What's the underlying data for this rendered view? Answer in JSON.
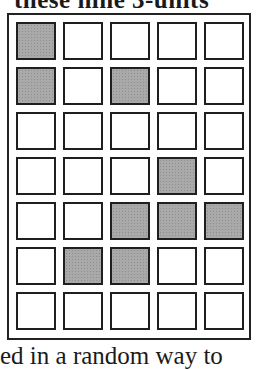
{
  "caption_top": "these nine 3-units",
  "caption_bottom": "ed in a random way to",
  "grid": {
    "rows": 7,
    "cols": 5,
    "shaded_color": "#a9a9a9",
    "cells": [
      [
        1,
        0,
        0,
        0,
        0
      ],
      [
        1,
        0,
        1,
        0,
        0
      ],
      [
        0,
        0,
        0,
        0,
        0
      ],
      [
        0,
        0,
        0,
        1,
        0
      ],
      [
        0,
        0,
        1,
        1,
        1
      ],
      [
        0,
        1,
        1,
        0,
        0
      ],
      [
        0,
        0,
        0,
        0,
        0
      ]
    ]
  }
}
